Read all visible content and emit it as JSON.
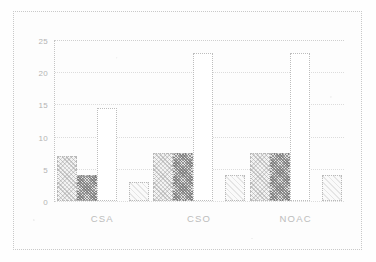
{
  "chart_data": {
    "type": "bar",
    "title": "",
    "subtitle": "",
    "xlabel": "",
    "ylabel": "",
    "categories": [
      "CSA",
      "CSO",
      "NOAC"
    ],
    "series": [
      {
        "name": "series-1",
        "values": [
          7,
          7.5,
          7.5
        ]
      },
      {
        "name": "series-2",
        "values": [
          4,
          7.5,
          7.5
        ]
      },
      {
        "name": "series-3",
        "values": [
          14.5,
          23,
          23
        ]
      },
      {
        "name": "series-4",
        "values": [
          3,
          4,
          4
        ]
      }
    ],
    "ylim": [
      0,
      25
    ],
    "ytick_labels": [
      "25",
      "20",
      "15",
      "10",
      "5",
      "0"
    ],
    "ytick_values": [
      25,
      20,
      15,
      10,
      5,
      0
    ],
    "grid": true,
    "legend": "none",
    "legend_position": "none",
    "annotations": []
  },
  "axes": {
    "y": {
      "ticks": [
        {
          "label": "25",
          "value": 25
        },
        {
          "label": "20",
          "value": 20
        },
        {
          "label": "15",
          "value": 15
        },
        {
          "label": "10",
          "value": 10
        },
        {
          "label": "5",
          "value": 5
        },
        {
          "label": "0",
          "value": 0
        }
      ]
    },
    "x": {
      "ticks": [
        {
          "label": "CSA"
        },
        {
          "label": "CSO"
        },
        {
          "label": "NOAC"
        }
      ]
    }
  },
  "colors": {
    "series_1": "#f3f3f3",
    "series_2": "#e2e2e2",
    "series_3": "#ffffff",
    "series_4": "#fafafa",
    "grid": "#dcdcdc",
    "axis": "#c4c4c4",
    "text": "#bcbcbc",
    "frame": "#c9c9c9",
    "background": "#fdfdfd"
  }
}
